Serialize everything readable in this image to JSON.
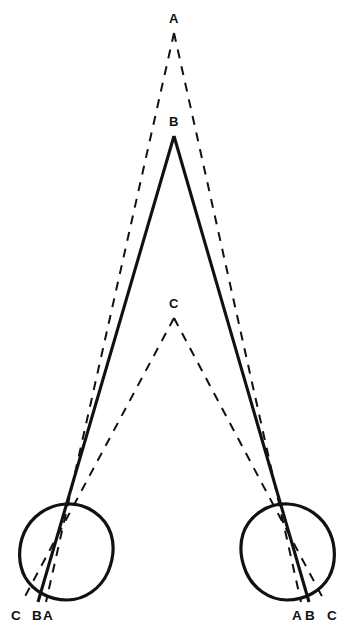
{
  "figure": {
    "background_color": "#ffffff",
    "stroke_color": "#111111",
    "canvas": {
      "width": 354,
      "height": 632
    }
  },
  "points": [
    {
      "id": "A",
      "label": "A",
      "role": "far-point-apex",
      "line_style": "dashed",
      "apex": {
        "x": 174,
        "y": 33
      },
      "label_pos": {
        "x": 169,
        "y": 12
      }
    },
    {
      "id": "B",
      "label": "B",
      "role": "mid-point-apex",
      "line_style": "solid",
      "apex": {
        "x": 174,
        "y": 136
      },
      "label_pos": {
        "x": 169,
        "y": 115
      }
    },
    {
      "id": "C",
      "label": "C",
      "role": "near-point-apex",
      "line_style": "dashed",
      "apex": {
        "x": 174,
        "y": 318
      },
      "label_pos": {
        "x": 169,
        "y": 297
      }
    }
  ],
  "eyes": [
    {
      "id": "left-eye",
      "side": "left",
      "center": {
        "x": 66,
        "y": 551
      },
      "radius": 47,
      "image_labels": [
        {
          "label": "C",
          "x": 12,
          "y": 609
        },
        {
          "label": "B",
          "x": 33,
          "y": 609
        },
        {
          "label": "A",
          "x": 44,
          "y": 609
        }
      ],
      "label_order": "C B A"
    },
    {
      "id": "right-eye",
      "side": "right",
      "center": {
        "x": 288,
        "y": 551
      },
      "radius": 47,
      "image_labels": [
        {
          "label": "A",
          "x": 293,
          "y": 609
        },
        {
          "label": "B",
          "x": 306,
          "y": 609
        },
        {
          "label": "C",
          "x": 328,
          "y": 609
        }
      ],
      "label_order": "A B C"
    }
  ],
  "rays": [
    {
      "from": "A",
      "to": "left-eye",
      "style": "dashed",
      "x1": 174,
      "y1": 33,
      "x2": 46,
      "y2": 602
    },
    {
      "from": "A",
      "to": "right-eye",
      "style": "dashed",
      "x1": 174,
      "y1": 33,
      "x2": 301,
      "y2": 602
    },
    {
      "from": "B",
      "to": "left-eye",
      "style": "solid",
      "x1": 174,
      "y1": 136,
      "x2": 38,
      "y2": 602
    },
    {
      "from": "B",
      "to": "right-eye",
      "style": "solid",
      "x1": 174,
      "y1": 136,
      "x2": 309,
      "y2": 602
    },
    {
      "from": "C",
      "to": "left-eye",
      "style": "dashed",
      "x1": 174,
      "y1": 318,
      "x2": 22,
      "y2": 602
    },
    {
      "from": "C",
      "to": "right-eye",
      "style": "dashed",
      "x1": 174,
      "y1": 318,
      "x2": 325,
      "y2": 602
    }
  ],
  "style_tokens": {
    "solid_width": 3.1,
    "dashed_width": 2.0,
    "dash_pattern": "9 8",
    "circle_width": 3.2
  }
}
